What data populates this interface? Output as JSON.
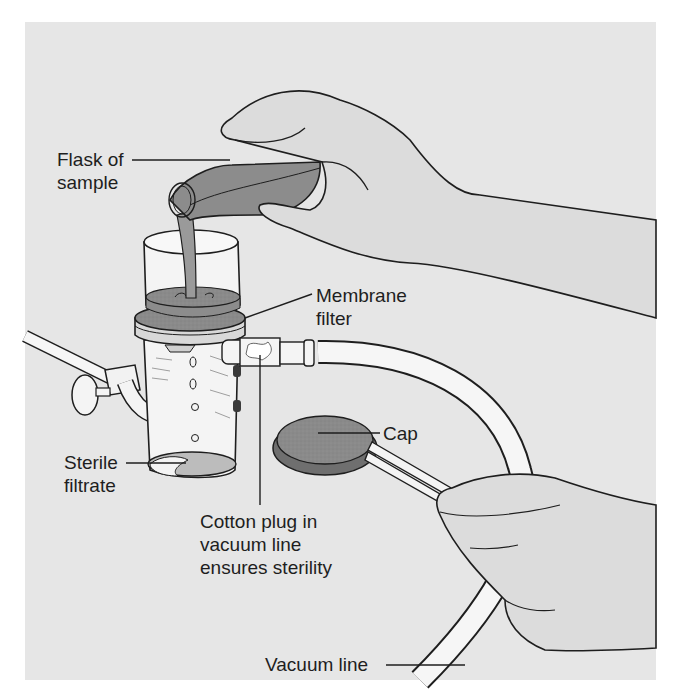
{
  "figure": {
    "colors": {
      "background": "#e6e6e6",
      "outline": "#1e1e1e",
      "liquid_dark": "#8a8a8a",
      "liquid_mid": "#a6a6a6",
      "glass": "#f4f4f4",
      "skin": "#dcdcdc",
      "cap": "#8c8c8c"
    },
    "labels": {
      "flask": "Flask of\nsample",
      "membrane": "Membrane\nfilter",
      "filtrate": "Sterile\nfiltrate",
      "cap": "Cap",
      "cotton": "Cotton plug in\nvacuum line\nensures sterility",
      "vacuum": "Vacuum line"
    }
  }
}
